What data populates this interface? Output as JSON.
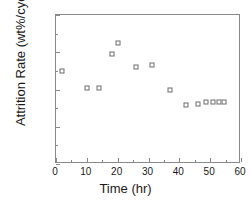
{
  "chart_data": {
    "type": "scatter",
    "title": "",
    "xlabel": "Time (hr)",
    "ylabel": "Attrition Rate (wt%/cycle)",
    "xlim": [
      0,
      60
    ],
    "ylim": [
      0.0,
      0.16
    ],
    "xticks": [
      0,
      10,
      20,
      30,
      40,
      50,
      60
    ],
    "xtick_labels": [
      "0",
      "10",
      "20",
      "30",
      "40",
      "50",
      "60"
    ],
    "yticks": [
      0.0,
      0.04,
      0.08,
      0.12,
      0.16
    ],
    "ytick_labels": [
      "0.00",
      "0.04",
      "0.08",
      "0.12",
      "0.16"
    ],
    "x_minor_ticks": [
      5,
      15,
      25,
      35,
      45,
      55
    ],
    "y_minor_ticks": [
      0.02,
      0.06,
      0.1,
      0.14
    ],
    "grid": false,
    "legend": null,
    "marker": "open-square",
    "marker_color": "#6d6d6d",
    "series": [
      {
        "name": "Attrition Rate",
        "x": [
          2,
          10,
          14,
          18,
          20,
          26,
          31,
          37,
          42,
          46,
          48.5,
          51,
          53,
          54.5
        ],
        "y": [
          0.1,
          0.082,
          0.082,
          0.118,
          0.13,
          0.104,
          0.106,
          0.08,
          0.063,
          0.064,
          0.067,
          0.067,
          0.067,
          0.067
        ]
      }
    ]
  },
  "axes": {
    "frame_color": "#8a8a8a",
    "background": "#ffffff"
  }
}
